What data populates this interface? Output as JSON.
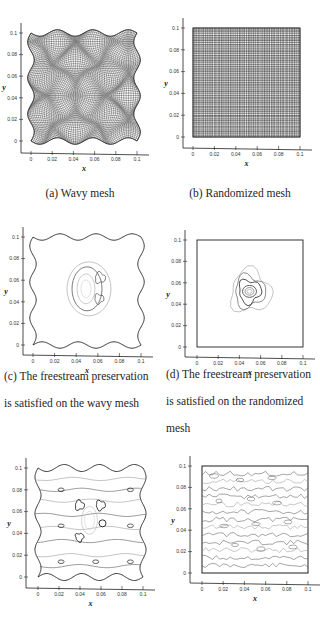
{
  "figure": {
    "panels": [
      {
        "id": "a",
        "caption": "(a)  Wavy mesh",
        "type": "mesh",
        "mesh": "wavy",
        "xlabel": "x",
        "ylabel": "y",
        "xticks": [
          "0",
          "0.02",
          "0.04",
          "0.06",
          "0.08",
          "0.1"
        ],
        "yticks": [
          "0",
          "0.02",
          "0.04",
          "0.06",
          "0.08",
          "0.1"
        ]
      },
      {
        "id": "b",
        "caption": "(b)  Randomized mesh",
        "type": "mesh",
        "mesh": "randomized",
        "xlabel": "x",
        "ylabel": "y",
        "xticks": [
          "0",
          "0.02",
          "0.04",
          "0.06",
          "0.08",
          "0.1"
        ],
        "yticks": [
          "0",
          "0.02",
          "0.04",
          "0.06",
          "0.08",
          "0.1"
        ]
      },
      {
        "id": "c",
        "caption_lines": [
          "(c)  The  freestream  preservation",
          "is satisfied on the wavy mesh"
        ],
        "type": "contour",
        "mesh": "wavy",
        "xlabel": "x",
        "ylabel": "y",
        "xticks": [
          "0",
          "0.02",
          "0.04",
          "0.06",
          "0.08",
          "0.1"
        ],
        "yticks": [
          "0",
          "0.02",
          "0.04",
          "0.06",
          "0.08",
          "0.1"
        ]
      },
      {
        "id": "d",
        "caption_lines": [
          "(d)  The  freestream  preservation",
          "is  satisfied  on  the  randomized",
          "mesh"
        ],
        "type": "contour",
        "mesh": "randomized",
        "xlabel": "x",
        "ylabel": "y",
        "xticks": [
          "0",
          "0.02",
          "0.04",
          "0.06",
          "0.08",
          "0.1"
        ],
        "yticks": [
          "0",
          "0.02",
          "0.04",
          "0.06",
          "0.08",
          "0.1"
        ]
      },
      {
        "id": "e",
        "type": "contour",
        "mesh": "wavy",
        "xlabel": "x",
        "ylabel": "y",
        "xticks": [
          "0",
          "0.02",
          "0.04",
          "0.06",
          "0.08",
          "0.1"
        ],
        "yticks": [
          "0",
          "0.02",
          "0.04",
          "0.06",
          "0.08",
          "0.1"
        ]
      },
      {
        "id": "f",
        "type": "contour",
        "mesh": "randomized",
        "xlabel": "x",
        "ylabel": "y",
        "xticks": [
          "0",
          "0.02",
          "0.04",
          "0.06",
          "0.08",
          "0.1"
        ],
        "yticks": [
          "0",
          "0.02",
          "0.04",
          "0.06",
          "0.08",
          "0.1"
        ]
      }
    ]
  },
  "colors": {
    "line": "#1f1f1f",
    "contour_light": "#9a9a9a",
    "contour_mid": "#5a5a5a"
  }
}
